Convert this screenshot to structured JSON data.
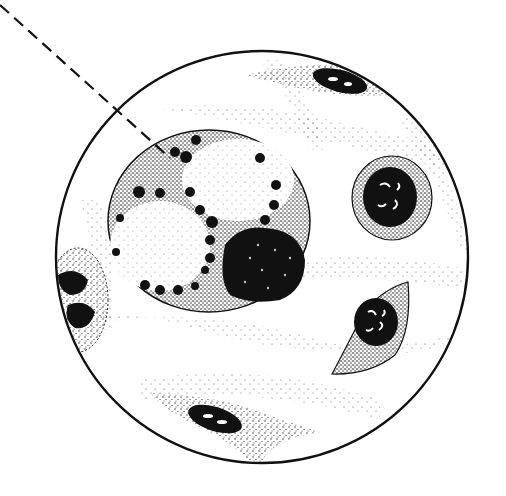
{
  "illustration": {
    "kind": "stippled micrograph drawing",
    "background": "#ffffff",
    "ink": "#111111",
    "field": {
      "cx": 262,
      "cy": 257,
      "r": 206
    },
    "pointer": {
      "x1": 0,
      "y1": 5,
      "x2": 170,
      "y2": 158,
      "style": "dashed"
    },
    "large_cell": {
      "cx": 209,
      "cy": 221,
      "rx": 101,
      "ry": 91,
      "vacuoles": [
        {
          "cx": 238,
          "cy": 180,
          "rx": 58,
          "ry": 42
        },
        {
          "cx": 162,
          "cy": 245,
          "rx": 52,
          "ry": 47
        }
      ],
      "nucleus": {
        "cx": 258,
        "cy": 262,
        "rx": 47,
        "ry": 44
      }
    },
    "small_cells": [
      {
        "name": "round-cell",
        "cx": 392,
        "cy": 198,
        "rx": 40,
        "ry": 42,
        "nucleus": {
          "cx": 390,
          "cy": 197,
          "rx": 27,
          "ry": 30
        }
      },
      {
        "name": "spindle-cell",
        "cx": 378,
        "cy": 328,
        "rx": 38,
        "ry": 50,
        "nucleus": {
          "cx": 375,
          "cy": 322,
          "rx": 23,
          "ry": 25
        }
      },
      {
        "name": "top-elongated-cell",
        "cx": 340,
        "cy": 83,
        "rx": 48,
        "ry": 14,
        "nucleus": {
          "cx": 340,
          "cy": 80,
          "rx": 28,
          "ry": 12
        }
      },
      {
        "name": "bottom-elongated-cell",
        "cx": 215,
        "cy": 418,
        "rx": 60,
        "ry": 16,
        "nucleus": {
          "cx": 215,
          "cy": 420,
          "rx": 27,
          "ry": 13
        }
      },
      {
        "name": "left-edge-cell",
        "cx": 78,
        "cy": 300,
        "rx": 28,
        "ry": 50,
        "nucleus": {
          "cx": 75,
          "cy": 300,
          "rx": 18,
          "ry": 40
        }
      }
    ]
  }
}
